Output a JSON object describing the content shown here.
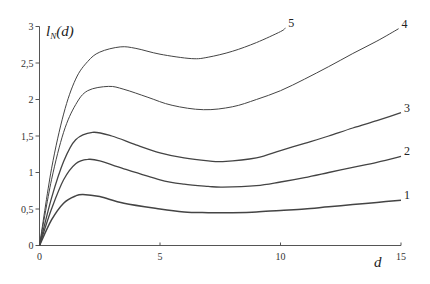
{
  "chart_data": {
    "type": "line",
    "title": "",
    "xlabel": "d",
    "ylabel": "l_N(d)",
    "ylabel_main": "l",
    "ylabel_sub": "N",
    "ylabel_rest": "(d)",
    "xlim": [
      0,
      15
    ],
    "ylim": [
      0,
      3
    ],
    "grid": false,
    "legend": "inline labels at curve ends",
    "x_ticks": [
      0,
      5,
      10,
      15
    ],
    "x_tick_labels": [
      "0",
      "5",
      "10",
      "15"
    ],
    "y_ticks": [
      0,
      0.5,
      1,
      1.5,
      2,
      2.5,
      3
    ],
    "y_tick_labels": [
      "0",
      "0,5",
      "1",
      "1,5",
      "2",
      "2,5",
      "3"
    ],
    "series": [
      {
        "name": "1",
        "points": [
          [
            0,
            0
          ],
          [
            0.5,
            0.35
          ],
          [
            1,
            0.58
          ],
          [
            1.5,
            0.68
          ],
          [
            1.8,
            0.7
          ],
          [
            2.5,
            0.67
          ],
          [
            3.5,
            0.58
          ],
          [
            5,
            0.5
          ],
          [
            6,
            0.46
          ],
          [
            7,
            0.45
          ],
          [
            8,
            0.45
          ],
          [
            9,
            0.46
          ],
          [
            10,
            0.48
          ],
          [
            11,
            0.5
          ],
          [
            12,
            0.53
          ],
          [
            13,
            0.56
          ],
          [
            14,
            0.59
          ],
          [
            15,
            0.62
          ]
        ]
      },
      {
        "name": "2",
        "points": [
          [
            0,
            0
          ],
          [
            0.5,
            0.5
          ],
          [
            1,
            0.9
          ],
          [
            1.5,
            1.12
          ],
          [
            2,
            1.18
          ],
          [
            2.5,
            1.16
          ],
          [
            3.5,
            1.05
          ],
          [
            5,
            0.9
          ],
          [
            6,
            0.84
          ],
          [
            7,
            0.81
          ],
          [
            7.6,
            0.8
          ],
          [
            9,
            0.82
          ],
          [
            10,
            0.87
          ],
          [
            11,
            0.93
          ],
          [
            12,
            1.0
          ],
          [
            13,
            1.07
          ],
          [
            14,
            1.14
          ],
          [
            15,
            1.22
          ]
        ]
      },
      {
        "name": "3",
        "points": [
          [
            0,
            0
          ],
          [
            0.5,
            0.65
          ],
          [
            1,
            1.15
          ],
          [
            1.5,
            1.45
          ],
          [
            2.2,
            1.55
          ],
          [
            3,
            1.5
          ],
          [
            4,
            1.38
          ],
          [
            5,
            1.27
          ],
          [
            6,
            1.2
          ],
          [
            7,
            1.16
          ],
          [
            7.6,
            1.15
          ],
          [
            9,
            1.2
          ],
          [
            10,
            1.3
          ],
          [
            11,
            1.4
          ],
          [
            12,
            1.5
          ],
          [
            13,
            1.61
          ],
          [
            14,
            1.71
          ],
          [
            15,
            1.82
          ]
        ]
      },
      {
        "name": "4",
        "points": [
          [
            0,
            0
          ],
          [
            0.5,
            0.9
          ],
          [
            1,
            1.55
          ],
          [
            1.5,
            1.93
          ],
          [
            2,
            2.12
          ],
          [
            2.86,
            2.18
          ],
          [
            3.5,
            2.14
          ],
          [
            4.5,
            2.03
          ],
          [
            5.5,
            1.92
          ],
          [
            6.8,
            1.86
          ],
          [
            8,
            1.9
          ],
          [
            9,
            2.0
          ],
          [
            10,
            2.12
          ],
          [
            11,
            2.28
          ],
          [
            12,
            2.45
          ],
          [
            13,
            2.63
          ],
          [
            14,
            2.8
          ],
          [
            14.9,
            2.97
          ]
        ]
      },
      {
        "name": "5",
        "points": [
          [
            0,
            0
          ],
          [
            0.5,
            1.05
          ],
          [
            1,
            1.8
          ],
          [
            1.5,
            2.28
          ],
          [
            2,
            2.52
          ],
          [
            2.5,
            2.65
          ],
          [
            3.35,
            2.72
          ],
          [
            4,
            2.7
          ],
          [
            5,
            2.62
          ],
          [
            6.3,
            2.56
          ],
          [
            7,
            2.58
          ],
          [
            8,
            2.66
          ],
          [
            9,
            2.78
          ],
          [
            10,
            2.93
          ],
          [
            10.2,
            2.98
          ]
        ]
      }
    ]
  }
}
